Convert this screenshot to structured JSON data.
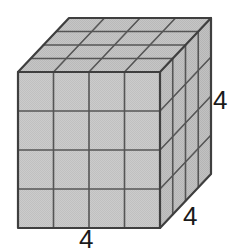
{
  "figure": {
    "name": "cube-4x4x4-isometric",
    "background_color": "#ffffff",
    "shape": {
      "type": "cube",
      "divisions_per_edge": 4,
      "total_unit_cubes": 64,
      "visible_faces": [
        "front",
        "top",
        "right"
      ],
      "face_fill_color": "#c9c9c9",
      "top_face_fill_color": "#c2c2c2",
      "right_face_fill_color": "#bdbdbd",
      "edge_color": "#4a4a4a",
      "grid_line_color": "#555555",
      "outline_width": 2.2,
      "grid_line_width": 1.6
    },
    "geometry": {
      "front_top_left": [
        18,
        72
      ],
      "front_top_right": [
        160,
        72
      ],
      "front_bottom_left": [
        18,
        228
      ],
      "front_bottom_right": [
        160,
        228
      ],
      "back_top_left": [
        69,
        18
      ],
      "back_top_right": [
        211,
        18
      ],
      "back_bottom_right": [
        211,
        174
      ]
    },
    "labels": {
      "depth": "4",
      "height": "4",
      "width": "4"
    },
    "label_color": "#1a1a1a"
  }
}
